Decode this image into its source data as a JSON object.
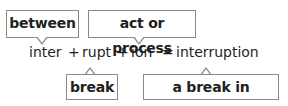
{
  "labels_top": [
    {
      "text": "between"
    },
    {
      "text": "act or process"
    }
  ],
  "equation": {
    "parts": [
      "inter",
      "+",
      "rupt",
      "+",
      "ion",
      "=",
      "interruption"
    ]
  },
  "labels_bottom": [
    {
      "text": "break"
    },
    {
      "text": "a break in activity"
    }
  ]
}
